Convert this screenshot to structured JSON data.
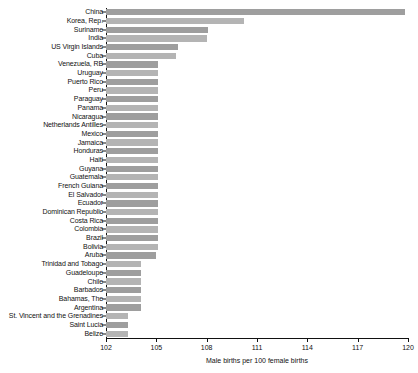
{
  "chart_data": {
    "type": "bar",
    "orientation": "horizontal",
    "title": "",
    "xlabel": "Male births per 100 female births",
    "ylabel": "",
    "xlim": [
      102,
      120
    ],
    "xticks": [
      102,
      105,
      108,
      111,
      114,
      117,
      120
    ],
    "grid": false,
    "legend": null,
    "bar_color": "#9a9a9a",
    "categories": [
      "China",
      "Korea, Rep.",
      "Suriname",
      "India",
      "US Virgin Islands",
      "Cuba",
      "Venezuela, RB",
      "Uruguay",
      "Puerto Rico",
      "Peru",
      "Paraguay",
      "Panama",
      "Nicaragua",
      "Netherlands Antilles",
      "Mexico",
      "Jamaica",
      "Honduras",
      "Haiti",
      "Guyana",
      "Guatemala",
      "French Guiana",
      "El Salvador",
      "Ecuador",
      "Dominican Republic",
      "Costa Rica",
      "Colombia",
      "Brazil",
      "Bolivia",
      "Aruba",
      "Trinidad and Tobago",
      "Guadeloupe",
      "Chile",
      "Barbados",
      "Bahamas, The",
      "Argentina",
      "St. Vincent and the Grenadines",
      "Saint Lucia",
      "Belize"
    ],
    "values": [
      119.8,
      110.2,
      108.1,
      108.0,
      106.3,
      106.2,
      105.1,
      105.1,
      105.1,
      105.1,
      105.1,
      105.1,
      105.1,
      105.1,
      105.1,
      105.1,
      105.1,
      105.1,
      105.1,
      105.1,
      105.1,
      105.1,
      105.1,
      105.1,
      105.1,
      105.1,
      105.1,
      105.1,
      105.0,
      104.1,
      104.1,
      104.1,
      104.1,
      104.1,
      104.1,
      103.3,
      103.3,
      103.3
    ]
  }
}
